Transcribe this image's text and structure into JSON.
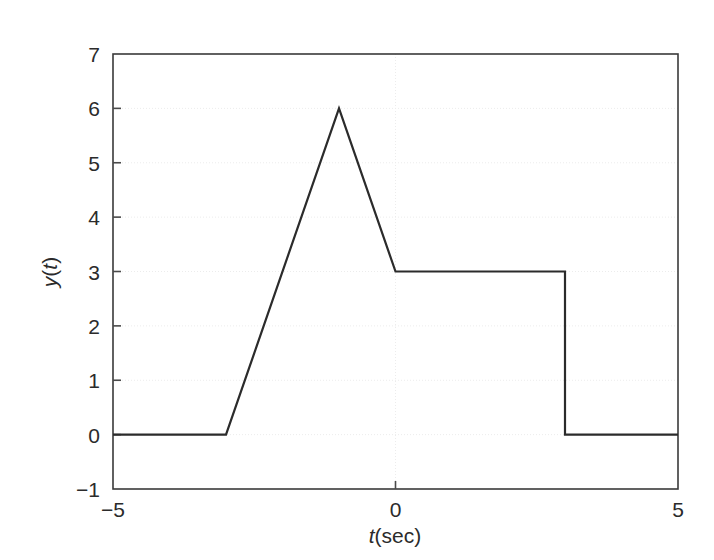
{
  "chart_data": {
    "type": "line",
    "title": "",
    "xlabel": "t(sec)",
    "ylabel": "y(t)",
    "xlabel_italic_part": "t",
    "xlabel_rest": "(sec)",
    "ylabel_parts": [
      "y",
      "(",
      "t",
      ")"
    ],
    "xlim": [
      -5,
      5
    ],
    "ylim": [
      -1,
      7
    ],
    "xticks": [
      -5,
      0,
      5
    ],
    "xtick_labels": [
      "−5",
      "0",
      "5"
    ],
    "yticks": [
      -1,
      0,
      1,
      2,
      3,
      4,
      5,
      6,
      7
    ],
    "ytick_labels": [
      "−1",
      "0",
      "1",
      "2",
      "3",
      "4",
      "5",
      "6",
      "7"
    ],
    "grid": true,
    "grid_style": "dotted",
    "legend": null,
    "series": [
      {
        "name": "y(t)",
        "color": "#2b2b2b",
        "line_width": 2.2,
        "x": [
          -5,
          -3,
          -1,
          0,
          3,
          3,
          5
        ],
        "y": [
          0,
          0,
          6,
          3,
          3,
          0,
          0
        ]
      }
    ],
    "annotations": [],
    "breakpoints": [
      {
        "t": -5,
        "y": 0,
        "note": "start of flat zero segment"
      },
      {
        "t": -3,
        "y": 0,
        "note": "ramp begins"
      },
      {
        "t": -1,
        "y": 6,
        "note": "peak"
      },
      {
        "t": 0,
        "y": 3,
        "note": "end of descent, start of plateau"
      },
      {
        "t": 3,
        "y": 3,
        "note": "plateau ends"
      },
      {
        "t": 3,
        "y": 0,
        "note": "step down to zero"
      },
      {
        "t": 5,
        "y": 0,
        "note": "end of trace"
      }
    ]
  },
  "axes": {
    "tick_color": "#4a4a4a",
    "frame_color": "#3a3a3a",
    "grid_color": "#ececec",
    "background": "#ffffff"
  }
}
